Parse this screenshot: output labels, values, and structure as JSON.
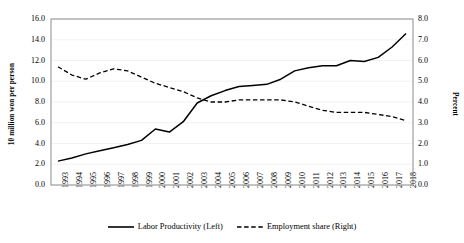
{
  "chart_data": {
    "type": "line",
    "title": "",
    "subtitle": "",
    "xlabel": "",
    "grid": true,
    "legend_position": "bottom",
    "x": [
      1993,
      1994,
      1995,
      1996,
      1997,
      1998,
      1999,
      2000,
      2001,
      2002,
      2003,
      2004,
      2005,
      2006,
      2007,
      2008,
      2009,
      2010,
      2011,
      2012,
      2013,
      2014,
      2015,
      2016,
      2017,
      2018
    ],
    "categories": [
      "1993",
      "1994",
      "1995",
      "1996",
      "1997",
      "1998",
      "1999",
      "2000",
      "2001",
      "2002",
      "2003",
      "2004",
      "2005",
      "2006",
      "2007",
      "2008",
      "2009",
      "2010",
      "2011",
      "2012",
      "2013",
      "2014",
      "2015",
      "2016",
      "2017",
      "2018"
    ],
    "axes": {
      "left": {
        "label": "10 million won per person",
        "ylim": [
          0.0,
          16.0
        ],
        "ticks": [
          "0.0",
          "2.0",
          "4.0",
          "6.0",
          "8.0",
          "10.0",
          "12.0",
          "14.0",
          "16.0"
        ],
        "tick_values": [
          0.0,
          2.0,
          4.0,
          6.0,
          8.0,
          10.0,
          12.0,
          14.0,
          16.0
        ]
      },
      "right": {
        "label": "Percent",
        "ylim": [
          0.0,
          8.0
        ],
        "ticks": [
          "0.0",
          "1.0",
          "2.0",
          "3.0",
          "4.0",
          "5.0",
          "6.0",
          "7.0",
          "8.0"
        ],
        "tick_values": [
          0.0,
          1.0,
          2.0,
          3.0,
          4.0,
          5.0,
          6.0,
          7.0,
          8.0
        ]
      }
    },
    "series": [
      {
        "name": "Labor Productivity (Left)",
        "axis": "left",
        "style": "solid",
        "color": "#000000",
        "values": [
          2.3,
          2.6,
          3.0,
          3.3,
          3.6,
          3.9,
          4.3,
          5.4,
          5.1,
          6.1,
          7.9,
          8.6,
          9.1,
          9.5,
          9.6,
          9.7,
          10.2,
          11.0,
          11.3,
          11.5,
          11.5,
          12.0,
          11.9,
          12.3,
          13.3,
          14.6
        ]
      },
      {
        "name": "Employment share (Right)",
        "axis": "right",
        "style": "dashed",
        "color": "#000000",
        "values": [
          5.7,
          5.3,
          5.1,
          5.4,
          5.6,
          5.5,
          5.2,
          4.9,
          4.7,
          4.5,
          4.2,
          4.0,
          4.0,
          4.1,
          4.1,
          4.1,
          4.1,
          4.0,
          3.8,
          3.6,
          3.5,
          3.5,
          3.5,
          3.4,
          3.3,
          3.1
        ]
      }
    ]
  },
  "legend": {
    "items": [
      {
        "label": "Labor Productivity (Left)",
        "style": "solid"
      },
      {
        "label": "Employment share (Right)",
        "style": "dashed"
      }
    ]
  }
}
